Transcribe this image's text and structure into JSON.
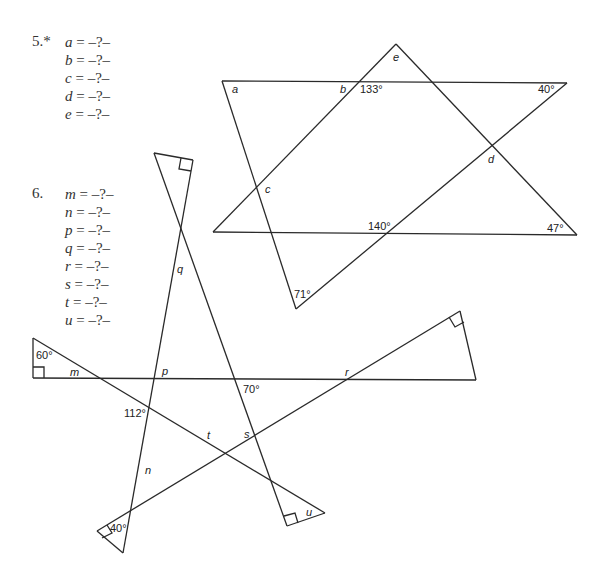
{
  "problems": [
    {
      "number": "5.*",
      "equations": [
        {
          "var": "a",
          "rhs": " = –?–"
        },
        {
          "var": "b",
          "rhs": " = –?–"
        },
        {
          "var": "c",
          "rhs": " = –?–"
        },
        {
          "var": "d",
          "rhs": " = –?–"
        },
        {
          "var": "e",
          "rhs": " = –?–"
        }
      ],
      "figure": {
        "labels": {
          "a": "a",
          "b": "b",
          "c": "c",
          "d": "d",
          "e": "e",
          "angle_133": "133°",
          "angle_40": "40°",
          "angle_140": "140°",
          "angle_47": "47°",
          "angle_71": "71°"
        }
      }
    },
    {
      "number": "6.",
      "equations": [
        {
          "var": "m",
          "rhs": " = –?–"
        },
        {
          "var": "n",
          "rhs": " = –?–"
        },
        {
          "var": "p",
          "rhs": " = –?–"
        },
        {
          "var": "q",
          "rhs": " = –?–"
        },
        {
          "var": "r",
          "rhs": " = –?–"
        },
        {
          "var": "s",
          "rhs": " = –?–"
        },
        {
          "var": "t",
          "rhs": " = –?–"
        },
        {
          "var": "u",
          "rhs": " = –?–"
        }
      ],
      "figure": {
        "labels": {
          "m": "m",
          "n": "n",
          "p": "p",
          "q": "q",
          "r": "r",
          "s": "s",
          "t": "t",
          "u": "u",
          "angle_60": "60°",
          "angle_112": "112°",
          "angle_70": "70°",
          "angle_40": "40°"
        }
      }
    }
  ]
}
